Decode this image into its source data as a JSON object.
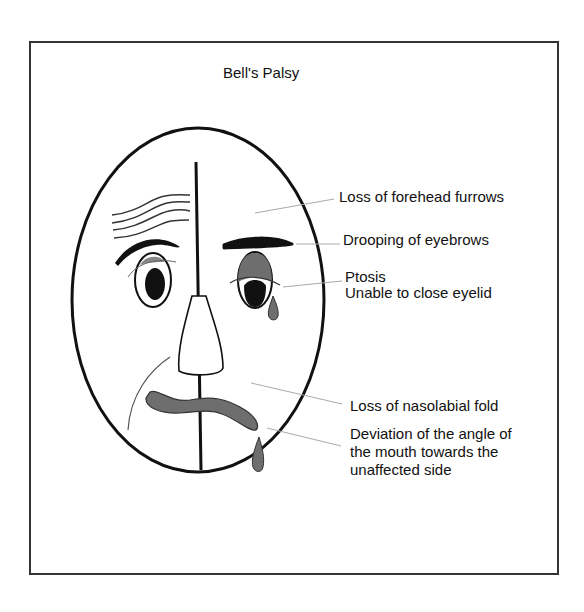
{
  "title": "Bell's Palsy",
  "colors": {
    "outline": "#111111",
    "gray_fill": "#6e6e6e",
    "leader_line": "#aaaaaa",
    "frame": "#333333"
  },
  "labels": {
    "forehead": "Loss of forehead furrows",
    "eyebrows": "Drooping of eyebrows",
    "ptosis": "Ptosis",
    "eyelid": "Unable to close eyelid",
    "nasolabial": "Loss of nasolabial fold",
    "mouth_line1": "Deviation of the angle of",
    "mouth_line2": "the mouth towards the",
    "mouth_line3": "unaffected side"
  }
}
